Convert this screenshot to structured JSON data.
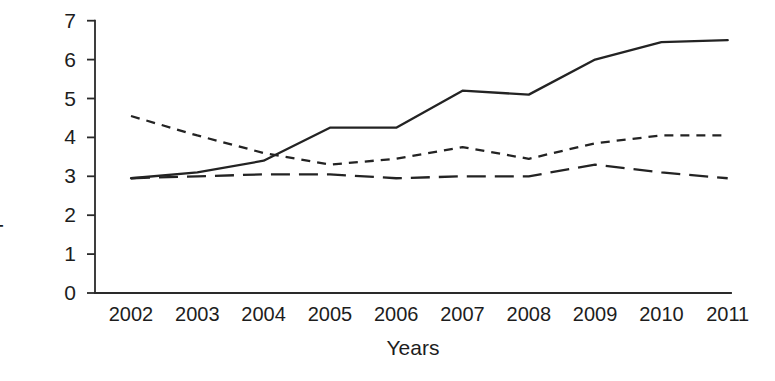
{
  "chart_data": {
    "type": "line",
    "title": "",
    "xlabel": "Years",
    "ylabel": "Impact factor",
    "categories": [
      "2002",
      "2003",
      "2004",
      "2005",
      "2006",
      "2007",
      "2008",
      "2009",
      "2010",
      "2011"
    ],
    "x": [
      2002,
      2003,
      2004,
      2005,
      2006,
      2007,
      2008,
      2009,
      2010,
      2011
    ],
    "xlim": [
      2002,
      2011
    ],
    "ylim": [
      0,
      7
    ],
    "yticks": [
      0,
      1,
      2,
      3,
      4,
      5,
      6,
      7
    ],
    "ytick_labels": [
      "0",
      "1",
      "2",
      "3",
      "4",
      "5",
      "6",
      "7"
    ],
    "grid": false,
    "legend": "none",
    "series": [
      {
        "name": "series-solid",
        "style": "solid",
        "color": "#232323",
        "values": [
          2.95,
          3.1,
          3.4,
          4.25,
          4.25,
          5.2,
          5.1,
          6.0,
          6.45,
          6.5
        ]
      },
      {
        "name": "series-short-dashed",
        "style": "short-dashed",
        "color": "#232323",
        "values": [
          4.55,
          4.05,
          3.6,
          3.3,
          3.45,
          3.75,
          3.45,
          3.85,
          4.05,
          4.05
        ]
      },
      {
        "name": "series-long-dashed",
        "style": "long-dashed",
        "color": "#232323",
        "values": [
          2.95,
          3.0,
          3.05,
          3.05,
          2.95,
          3.0,
          3.0,
          3.3,
          3.1,
          2.95
        ]
      }
    ]
  },
  "axes": {
    "y_title": "Impact factor",
    "x_title": "Years"
  }
}
